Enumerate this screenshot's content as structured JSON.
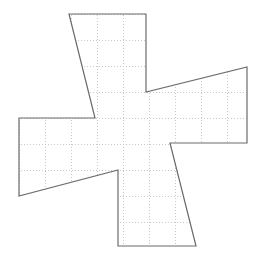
{
  "figure": {
    "canvas": {
      "width": 259,
      "height": 264,
      "background": "#ffffff"
    },
    "colors": {
      "outline": "#6b6b6b",
      "grid": "#c9c9c9",
      "fill": "none",
      "background": "#ffffff"
    },
    "outline": {
      "stroke_width": 1.2,
      "closed": true,
      "vertex_count": 16,
      "vertices": [
        {
          "label": "top-arm-top-left",
          "x": 69,
          "y": 14
        },
        {
          "label": "top-arm-top-right",
          "x": 146,
          "y": 14
        },
        {
          "label": "top-arm-bottom-right",
          "x": 146,
          "y": 92
        },
        {
          "label": "right-arm-top-right",
          "x": 247,
          "y": 67
        },
        {
          "label": "right-arm-bottom-right",
          "x": 247,
          "y": 143
        },
        {
          "label": "right-arm-bottom-left",
          "x": 170,
          "y": 143
        },
        {
          "label": "bottom-arm-bottom-right",
          "x": 196,
          "y": 246
        },
        {
          "label": "bottom-arm-bottom-left",
          "x": 118,
          "y": 246
        },
        {
          "label": "bottom-arm-top-left",
          "x": 118,
          "y": 170
        },
        {
          "label": "left-arm-bottom-left",
          "x": 19,
          "y": 196
        },
        {
          "label": "left-arm-top-left",
          "x": 19,
          "y": 118
        },
        {
          "label": "left-arm-top-right",
          "x": 95,
          "y": 118
        }
      ],
      "path": "M 69 14 L 146 14 L 146 92 L 247 67 L 247 143 L 170 143 L 196 246 L 118 246 L 118 170 L 19 196 L 19 118 L 95 118 Z"
    },
    "grid": {
      "type": "dotted",
      "spacing_px": 26,
      "origin_x": 19,
      "origin_y": 14,
      "stroke_width": 1,
      "dash_pattern": "1,2",
      "vertical_lines_x": [
        19,
        45,
        71,
        97,
        123,
        149,
        175,
        201,
        227,
        253
      ],
      "horizontal_lines_y": [
        14,
        40,
        66,
        92,
        118,
        144,
        170,
        196,
        222,
        248
      ]
    },
    "arms": [
      {
        "name": "top-arm",
        "orientation": "up"
      },
      {
        "name": "right-arm",
        "orientation": "right"
      },
      {
        "name": "bottom-arm",
        "orientation": "down"
      },
      {
        "name": "left-arm",
        "orientation": "left"
      }
    ]
  }
}
